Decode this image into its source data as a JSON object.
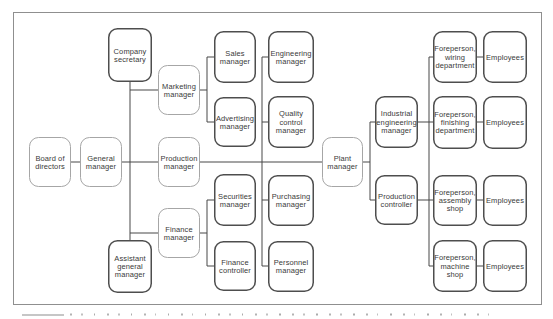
{
  "diagram": {
    "type": "org-chart",
    "description_visible_text_only": true,
    "colors": {
      "background": "#ffffff",
      "frame_border": "#8f8f8f",
      "box_border_light": "#a6a6a6",
      "box_border_dark": "#4e4e4e",
      "connector_line": "#494949",
      "text": "#3a3a3a"
    },
    "frame": {
      "x": 13,
      "y": 12,
      "w": 529,
      "h": 293
    },
    "nodes": [
      {
        "id": "board-of-directors",
        "label": "Board of\ndirectors",
        "x": 29,
        "y": 137,
        "w": 42,
        "h": 50,
        "variant": "light"
      },
      {
        "id": "general-manager",
        "label": "General\nmanager",
        "x": 80,
        "y": 137,
        "w": 42,
        "h": 50,
        "variant": "light"
      },
      {
        "id": "company-secretary",
        "label": "Company\nsecretary",
        "x": 108,
        "y": 28,
        "w": 44,
        "h": 54,
        "variant": "dark"
      },
      {
        "id": "marketing-manager",
        "label": "Marketing\nmanager",
        "x": 158,
        "y": 65,
        "w": 42,
        "h": 50,
        "variant": "light"
      },
      {
        "id": "production-manager",
        "label": "Production\nmanager",
        "x": 158,
        "y": 137,
        "w": 42,
        "h": 50,
        "variant": "light"
      },
      {
        "id": "finance-manager",
        "label": "Finance\nmanager",
        "x": 158,
        "y": 208,
        "w": 42,
        "h": 50,
        "variant": "light"
      },
      {
        "id": "assistant-general-manager",
        "label": "Assistant\ngeneral\nmanager",
        "x": 108,
        "y": 240,
        "w": 44,
        "h": 53,
        "variant": "dark"
      },
      {
        "id": "sales-manager",
        "label": "Sales\nmanager",
        "x": 214,
        "y": 31,
        "w": 42,
        "h": 52,
        "variant": "dark"
      },
      {
        "id": "advertising-manager",
        "label": "Advertising\nmanager",
        "x": 214,
        "y": 97,
        "w": 42,
        "h": 50,
        "variant": "dark"
      },
      {
        "id": "securities-manager",
        "label": "Securities\nmanager",
        "x": 214,
        "y": 174,
        "w": 42,
        "h": 52,
        "variant": "dark"
      },
      {
        "id": "finance-controller",
        "label": "Finance\ncontroller",
        "x": 214,
        "y": 241,
        "w": 42,
        "h": 50,
        "variant": "dark"
      },
      {
        "id": "engineering-manager",
        "label": "Engineering\nmanager",
        "x": 268,
        "y": 31,
        "w": 46,
        "h": 52,
        "variant": "dark"
      },
      {
        "id": "quality-control-manager",
        "label": "Quality\ncontrol\nmanager",
        "x": 268,
        "y": 96,
        "w": 46,
        "h": 52,
        "variant": "dark"
      },
      {
        "id": "purchasing-manager",
        "label": "Purchasing\nmanager",
        "x": 268,
        "y": 175,
        "w": 46,
        "h": 51,
        "variant": "dark"
      },
      {
        "id": "personnel-manager",
        "label": "Personnel\nmanager",
        "x": 268,
        "y": 241,
        "w": 46,
        "h": 51,
        "variant": "dark"
      },
      {
        "id": "plant-manager",
        "label": "Plant\nmanager",
        "x": 322,
        "y": 137,
        "w": 41,
        "h": 50,
        "variant": "light"
      },
      {
        "id": "industrial-engineering-manager",
        "label": "Industrial\nengineering\nmanager",
        "x": 375,
        "y": 96,
        "w": 43,
        "h": 52,
        "variant": "dark"
      },
      {
        "id": "production-controller",
        "label": "Production\ncontroller",
        "x": 375,
        "y": 175,
        "w": 43,
        "h": 50,
        "variant": "dark"
      },
      {
        "id": "foreperson-wiring",
        "label": "Foreperson,\nwiring\ndepartment",
        "x": 433,
        "y": 31,
        "w": 44,
        "h": 52,
        "variant": "dark"
      },
      {
        "id": "foreperson-finishing",
        "label": "Foreperson,\nfinishing\ndepartment",
        "x": 433,
        "y": 96,
        "w": 44,
        "h": 53,
        "variant": "dark"
      },
      {
        "id": "foreperson-assembly",
        "label": "Foreperson,\nassembly\nshop",
        "x": 433,
        "y": 175,
        "w": 44,
        "h": 51,
        "variant": "dark"
      },
      {
        "id": "foreperson-machine",
        "label": "Foreperson,\nmachine\nshop",
        "x": 433,
        "y": 240,
        "w": 44,
        "h": 52,
        "variant": "dark"
      },
      {
        "id": "employees-wiring",
        "label": "Employees",
        "x": 483,
        "y": 31,
        "w": 44,
        "h": 52,
        "variant": "dark"
      },
      {
        "id": "employees-finishing",
        "label": "Employees",
        "x": 483,
        "y": 96,
        "w": 44,
        "h": 53,
        "variant": "dark"
      },
      {
        "id": "employees-assembly",
        "label": "Employees",
        "x": 483,
        "y": 175,
        "w": 44,
        "h": 51,
        "variant": "dark"
      },
      {
        "id": "employees-machine",
        "label": "Employees",
        "x": 483,
        "y": 240,
        "w": 44,
        "h": 52,
        "variant": "dark"
      }
    ],
    "connectors": [
      {
        "x1": 71,
        "y1": 162,
        "x2": 80,
        "y2": 162
      },
      {
        "x1": 122,
        "y1": 162,
        "x2": 158,
        "y2": 162
      },
      {
        "x1": 200,
        "y1": 162,
        "x2": 322,
        "y2": 162
      },
      {
        "x1": 363,
        "y1": 162,
        "x2": 370,
        "y2": 162
      },
      {
        "x1": 130,
        "y1": 82,
        "x2": 130,
        "y2": 240
      },
      {
        "x1": 130,
        "y1": 90,
        "x2": 158,
        "y2": 90
      },
      {
        "x1": 130,
        "y1": 233,
        "x2": 158,
        "y2": 233
      },
      {
        "x1": 200,
        "y1": 90,
        "x2": 207,
        "y2": 90
      },
      {
        "x1": 207,
        "y1": 57,
        "x2": 207,
        "y2": 122
      },
      {
        "x1": 207,
        "y1": 57,
        "x2": 214,
        "y2": 57
      },
      {
        "x1": 207,
        "y1": 122,
        "x2": 214,
        "y2": 122
      },
      {
        "x1": 200,
        "y1": 233,
        "x2": 207,
        "y2": 233
      },
      {
        "x1": 207,
        "y1": 200,
        "x2": 207,
        "y2": 266
      },
      {
        "x1": 207,
        "y1": 200,
        "x2": 214,
        "y2": 200
      },
      {
        "x1": 207,
        "y1": 266,
        "x2": 214,
        "y2": 266
      },
      {
        "x1": 262,
        "y1": 57,
        "x2": 262,
        "y2": 266
      },
      {
        "x1": 262,
        "y1": 57,
        "x2": 268,
        "y2": 57
      },
      {
        "x1": 262,
        "y1": 122,
        "x2": 268,
        "y2": 122
      },
      {
        "x1": 262,
        "y1": 200,
        "x2": 268,
        "y2": 200
      },
      {
        "x1": 262,
        "y1": 266,
        "x2": 268,
        "y2": 266
      },
      {
        "x1": 370,
        "y1": 122,
        "x2": 370,
        "y2": 200
      },
      {
        "x1": 370,
        "y1": 122,
        "x2": 375,
        "y2": 122
      },
      {
        "x1": 370,
        "y1": 200,
        "x2": 375,
        "y2": 200
      },
      {
        "x1": 418,
        "y1": 122,
        "x2": 429,
        "y2": 122
      },
      {
        "x1": 418,
        "y1": 200,
        "x2": 429,
        "y2": 200
      },
      {
        "x1": 429,
        "y1": 57,
        "x2": 429,
        "y2": 266
      },
      {
        "x1": 429,
        "y1": 57,
        "x2": 433,
        "y2": 57
      },
      {
        "x1": 429,
        "y1": 122,
        "x2": 433,
        "y2": 122
      },
      {
        "x1": 429,
        "y1": 200,
        "x2": 433,
        "y2": 200
      },
      {
        "x1": 429,
        "y1": 266,
        "x2": 433,
        "y2": 266
      },
      {
        "x1": 477,
        "y1": 57,
        "x2": 483,
        "y2": 57
      },
      {
        "x1": 477,
        "y1": 122,
        "x2": 483,
        "y2": 122
      },
      {
        "x1": 477,
        "y1": 200,
        "x2": 483,
        "y2": 200
      },
      {
        "x1": 477,
        "y1": 266,
        "x2": 483,
        "y2": 266
      }
    ]
  }
}
